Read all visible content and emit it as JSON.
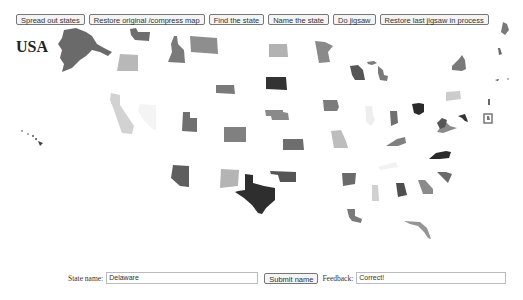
{
  "toolbar": {
    "buttons": [
      {
        "label": "Spread out states"
      },
      {
        "label": "Restore original /compress map"
      },
      {
        "label": "Find the state"
      },
      {
        "label": "Name the state"
      },
      {
        "label": "Do jigsaw"
      },
      {
        "label": "Restore last jigsaw in process"
      }
    ]
  },
  "map": {
    "title": "USA",
    "states": [
      {
        "name": "Alaska",
        "color": "#6a6a6a"
      },
      {
        "name": "Hawaii",
        "color": "#444444"
      },
      {
        "name": "Washington",
        "color": "#6e6e6e"
      },
      {
        "name": "Oregon",
        "color": "#b8b8b8"
      },
      {
        "name": "California",
        "color": "#7a7a7a"
      },
      {
        "name": "Nevada",
        "color": "#8e8e8e"
      },
      {
        "name": "Idaho",
        "color": "#7a7a7a"
      },
      {
        "name": "Montana",
        "color": "#d2d2d2"
      },
      {
        "name": "Wyoming",
        "color": "#f4f4f4"
      },
      {
        "name": "Utah",
        "color": "#707070"
      },
      {
        "name": "Colorado",
        "color": "#808080"
      },
      {
        "name": "Arizona",
        "color": "#5e5e5e"
      },
      {
        "name": "New Mexico",
        "color": "#b4b4b4"
      },
      {
        "name": "North Dakota",
        "color": "#2e2e2e"
      },
      {
        "name": "South Dakota",
        "color": "#555555"
      },
      {
        "name": "Nebraska",
        "color": "#b2b2b2"
      },
      {
        "name": "Kansas",
        "color": "#333333"
      },
      {
        "name": "Oklahoma",
        "color": "#8a8a8a"
      },
      {
        "name": "Texas",
        "color": "#6e6e6e"
      },
      {
        "name": "Minnesota",
        "color": "#8a8a8a"
      },
      {
        "name": "Iowa",
        "color": "#7c7c7c"
      },
      {
        "name": "Missouri",
        "color": "#bdbdbd"
      },
      {
        "name": "Arkansas",
        "color": "#6a6a6a"
      },
      {
        "name": "Louisiana",
        "color": "#7a7a7a"
      },
      {
        "name": "Wisconsin",
        "color": "#555555"
      },
      {
        "name": "Michigan",
        "color": "#7a7a7a"
      },
      {
        "name": "Illinois",
        "color": "#eeeeee"
      },
      {
        "name": "Indiana",
        "color": "#707070"
      },
      {
        "name": "Ohio",
        "color": "#2a2a2a"
      },
      {
        "name": "Kentucky",
        "color": "#808080"
      },
      {
        "name": "Tennessee",
        "color": "#f2f2f2"
      },
      {
        "name": "Mississippi",
        "color": "#d0d0d0"
      },
      {
        "name": "Alabama",
        "color": "#4e4e4e"
      },
      {
        "name": "Georgia",
        "color": "#8a8a8a"
      },
      {
        "name": "Florida",
        "color": "#959595"
      },
      {
        "name": "South Carolina",
        "color": "#6a6a6a"
      },
      {
        "name": "North Carolina",
        "color": "#2a2a2a"
      },
      {
        "name": "Virginia",
        "color": "#8a8a8a"
      },
      {
        "name": "West Virginia",
        "color": "#555555"
      },
      {
        "name": "Pennsylvania",
        "color": "#cccccc"
      },
      {
        "name": "New York",
        "color": "#7a7a7a"
      },
      {
        "name": "Maryland",
        "color": "#333333"
      },
      {
        "name": "Delaware",
        "color": "#777777"
      },
      {
        "name": "New Jersey",
        "color": "#666666"
      },
      {
        "name": "Maine",
        "color": "#7a7a7a"
      },
      {
        "name": "New Hampshire",
        "color": "#6a6a6a"
      },
      {
        "name": "Vermont",
        "color": "#ffffff"
      },
      {
        "name": "Massachusetts",
        "color": "#444444"
      },
      {
        "name": "Connecticut",
        "color": "#999999"
      },
      {
        "name": "Rhode Island",
        "color": "#aaaaaa"
      }
    ]
  },
  "form": {
    "state_label": "State name:",
    "state_value": "Delaware",
    "submit_label": "Submit name",
    "feedback_label": "Feedback:",
    "feedback_value": "Correct!"
  }
}
